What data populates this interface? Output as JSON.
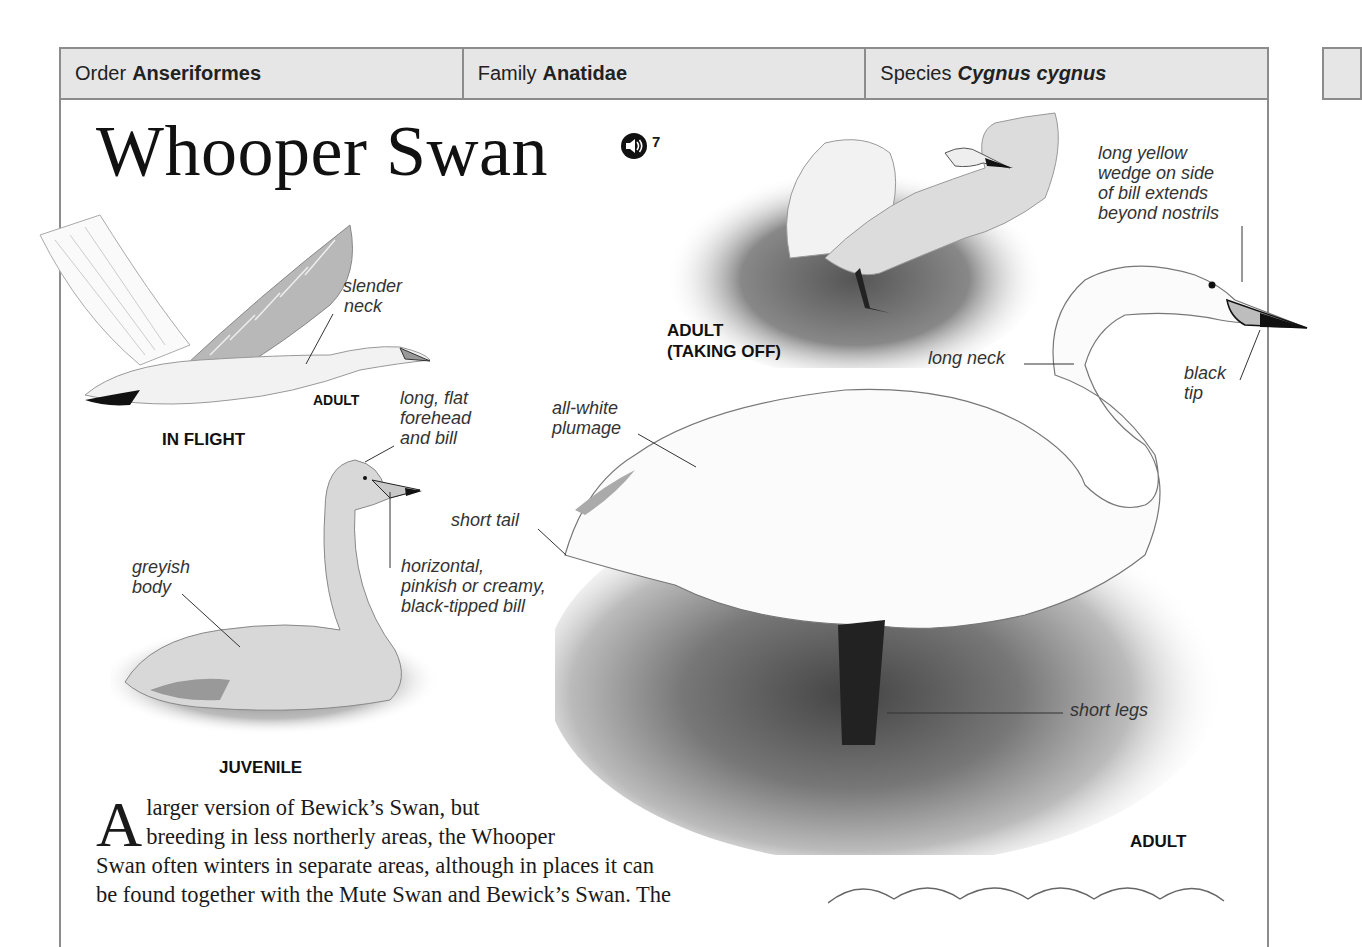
{
  "taxonomy": {
    "order": {
      "label": "Order",
      "value": "Anseriformes"
    },
    "family": {
      "label": "Family",
      "value": "Anatidae"
    },
    "species": {
      "label": "Species",
      "value": "Cygnus cygnus"
    }
  },
  "title": "Whooper Swan",
  "audio": {
    "icon": "speaker-icon",
    "track": "7"
  },
  "figures": {
    "in_flight": {
      "caption": "IN FLIGHT",
      "sub_caption": "ADULT",
      "annotations": [
        "slender neck"
      ]
    },
    "juvenile": {
      "caption": "JUVENILE",
      "annotations": [
        "long, flat forehead and bill",
        "horizontal, pinkish or creamy, black-tipped bill",
        "greyish body"
      ]
    },
    "taking_off": {
      "caption_line1": "ADULT",
      "caption_line2": "(TAKING OFF)"
    },
    "adult": {
      "caption": "ADULT",
      "annotations": [
        "long yellow wedge on side of bill extends beyond nostrils",
        "long neck",
        "black tip",
        "all-white plumage",
        "short tail",
        "short legs"
      ]
    }
  },
  "annotations": {
    "slender_neck_1": "slender",
    "slender_neck_2": "neck",
    "forehead_1": "long, flat",
    "forehead_2": "forehead",
    "forehead_3": "and bill",
    "bill_1": "horizontal,",
    "bill_2": "pinkish or creamy,",
    "bill_3": "black-tipped bill",
    "greyish_1": "greyish",
    "greyish_2": "body",
    "wedge_1": "long yellow",
    "wedge_2": "wedge on side",
    "wedge_3": "of bill extends",
    "wedge_4": "beyond nostrils",
    "long_neck": "long neck",
    "black_tip_1": "black",
    "black_tip_2": "tip",
    "plumage_1": "all-white",
    "plumage_2": "plumage",
    "short_tail": "short tail",
    "short_legs": "short legs"
  },
  "body_text": {
    "drop_cap": "A",
    "line1": "larger version of Bewick’s Swan, but",
    "line2": "breeding in less northerly areas, the Whooper",
    "line3": "Swan often winters in separate areas, although in places it can",
    "line4": "be found together with the Mute Swan and Bewick’s Swan. The"
  },
  "colors": {
    "header_bg": "#e6e6e6",
    "rule": "#8c8c8c",
    "text": "#1a1a1a"
  }
}
